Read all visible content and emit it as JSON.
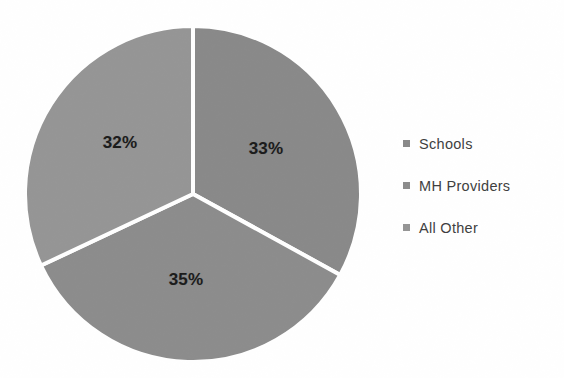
{
  "chart_data": {
    "type": "pie",
    "title": "",
    "subtitle": "",
    "xlabel": "",
    "ylabel": "",
    "categories": [
      "Schools",
      "MH Providers",
      "All Other"
    ],
    "values": [
      33,
      35,
      32
    ],
    "data_labels": [
      "33%",
      "35%",
      "32%"
    ],
    "legend_position": "right",
    "grid": false,
    "start_angle_deg": 0,
    "direction": "clockwise",
    "slice_gap_color": "#ffffff",
    "background": "#ffffff",
    "slices": [
      {
        "name": "Schools",
        "value": 33,
        "label": "33%",
        "color": "#8a8a8a",
        "label_x": 266,
        "label_y": 149
      },
      {
        "name": "MH Providers",
        "value": 35,
        "label": "35%",
        "color": "#8d8d8d",
        "label_x": 186,
        "label_y": 280
      },
      {
        "name": "All Other",
        "value": 32,
        "label": "32%",
        "color": "#969696",
        "label_x": 120,
        "label_y": 143
      }
    ]
  },
  "legend": {
    "items": [
      {
        "label": "Schools",
        "color": "#8a8a8a",
        "marker": "square-marker"
      },
      {
        "label": "MH Providers",
        "color": "#8d8d8d",
        "marker": "square-marker"
      },
      {
        "label": "All Other",
        "color": "#969696",
        "marker": "square-marker"
      }
    ]
  },
  "geometry": {
    "center_x": 193,
    "center_y": 194,
    "radius": 168
  }
}
